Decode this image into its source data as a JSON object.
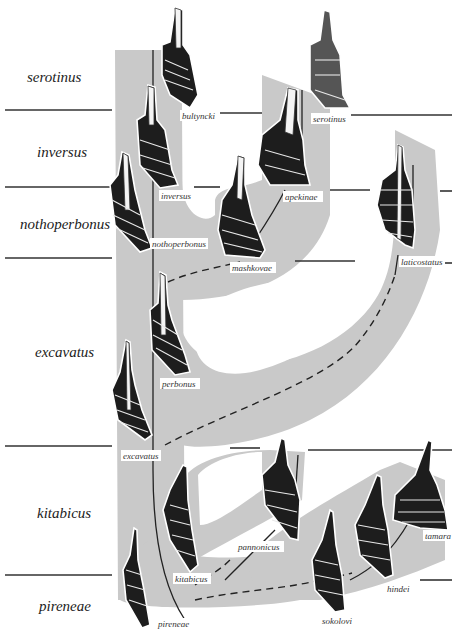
{
  "zones": [
    {
      "id": "serotinus",
      "label": "serotinus"
    },
    {
      "id": "inversus",
      "label": "inversus"
    },
    {
      "id": "nothoperbonus",
      "label": "nothoperbonus"
    },
    {
      "id": "excavatus",
      "label": "excavatus"
    },
    {
      "id": "kitabicus",
      "label": "kitabicus"
    },
    {
      "id": "pireneae",
      "label": "pireneae"
    }
  ],
  "taxa": [
    {
      "id": "bultyncki",
      "label": "bultyncki"
    },
    {
      "id": "serotinus",
      "label": "serotinus"
    },
    {
      "id": "inversus",
      "label": "inversus"
    },
    {
      "id": "apekinae",
      "label": "apekinae"
    },
    {
      "id": "nothoperbonus",
      "label": "nothoperbonus"
    },
    {
      "id": "mashkovae",
      "label": "mashkovae"
    },
    {
      "id": "laticostatus",
      "label": "laticostatus"
    },
    {
      "id": "perbonus",
      "label": "perbonus"
    },
    {
      "id": "excavatus",
      "label": "excavatus"
    },
    {
      "id": "kitabicus",
      "label": "kitabicus"
    },
    {
      "id": "pannonicus",
      "label": "pannonicus"
    },
    {
      "id": "tamara",
      "label": "tamara"
    },
    {
      "id": "hindei",
      "label": "hindei"
    },
    {
      "id": "sokolovi",
      "label": "sokolovi"
    },
    {
      "id": "pireneae",
      "label": "pireneae"
    }
  ],
  "colors": {
    "band": "#c9c9c9",
    "element": "#1d1d1d",
    "line": "#222222"
  }
}
